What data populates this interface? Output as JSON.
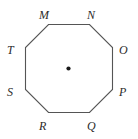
{
  "figure": {
    "type": "regular-octagon-with-center-point",
    "shape_name": "octagon",
    "stroke_color": "#555555",
    "fill_color": "#ffffff",
    "background_color": "#ffffff",
    "label_color": "#2b2b2b",
    "center_point": {
      "name": "center-dot",
      "x": 68.5,
      "y": 68.5,
      "radius": 2.1,
      "color": "#1a1a1a",
      "label": ""
    },
    "polygon_points": "48.5,24.5 89.5,24.5 112.5,47.5 112.5,89.5 89.5,112.5 48.5,112.5 25.5,89.5 25.5,47.5",
    "vertices": [
      {
        "label": "M",
        "vertex_x": 48.5,
        "vertex_y": 24.5,
        "label_x": 39,
        "label_y": 9
      },
      {
        "label": "N",
        "vertex_x": 89.5,
        "vertex_y": 24.5,
        "label_x": 87,
        "label_y": 9
      },
      {
        "label": "O",
        "vertex_x": 112.5,
        "vertex_y": 47.5,
        "label_x": 119,
        "label_y": 44
      },
      {
        "label": "P",
        "vertex_x": 112.5,
        "vertex_y": 89.5,
        "label_x": 119,
        "label_y": 86
      },
      {
        "label": "Q",
        "vertex_x": 89.5,
        "vertex_y": 112.5,
        "label_x": 87,
        "label_y": 120
      },
      {
        "label": "R",
        "vertex_x": 48.5,
        "vertex_y": 112.5,
        "label_x": 39,
        "label_y": 120
      },
      {
        "label": "S",
        "vertex_x": 25.5,
        "vertex_y": 89.5,
        "label_x": 7,
        "label_y": 86
      },
      {
        "label": "T",
        "vertex_x": 25.5,
        "vertex_y": 47.5,
        "label_x": 7,
        "label_y": 44
      }
    ]
  }
}
